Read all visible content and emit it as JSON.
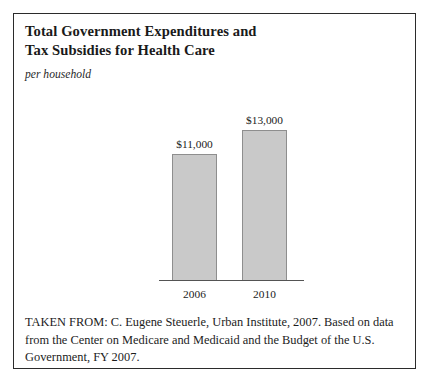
{
  "figure": {
    "title_line1": "Total Government Expenditures and",
    "title_line2": "Tax Subsidies for Health Care",
    "subtitle": "per household",
    "source": "TAKEN FROM: C. Eugene Steuerle, Urban Institute, 2007. Based on data from the Center on Medicare and Medicaid and the Budget of the U.S. Government, FY 2007.",
    "border_color": "#2b2b2b",
    "background_color": "#ffffff"
  },
  "chart_data": {
    "type": "bar",
    "title": "Total Government Expenditures and Tax Subsidies for Health Care",
    "subtitle": "per household",
    "categories": [
      "2006",
      "2010"
    ],
    "values": [
      11000,
      13000
    ],
    "data_labels": [
      "$11,000",
      "$13,000"
    ],
    "xlabel": "",
    "ylabel": "",
    "unit": "USD per household",
    "ylim": [
      0,
      14500
    ],
    "grid": false,
    "legend": false,
    "bar_fill_color": "#c9c9c9",
    "bar_border_color": "#8e8e8e",
    "axis_color": "#545454"
  }
}
